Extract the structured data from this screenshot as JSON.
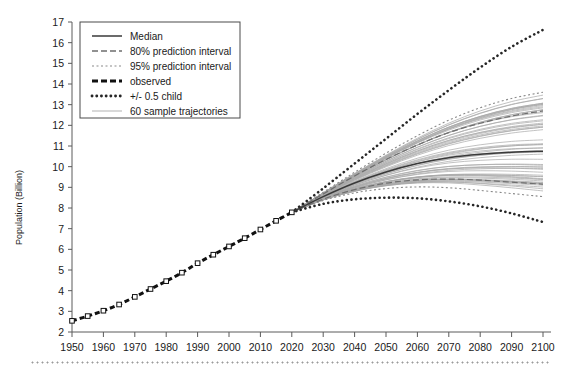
{
  "chart_data": {
    "type": "line",
    "title": "",
    "xlabel": "",
    "ylabel": "Population (Billion)",
    "xlim": [
      1945,
      2103
    ],
    "ylim": [
      2,
      17
    ],
    "grid": false,
    "legend_position": "top-left",
    "x_ticks": [
      1950,
      1960,
      1970,
      1980,
      1990,
      2000,
      2010,
      2020,
      2030,
      2040,
      2050,
      2060,
      2070,
      2080,
      2090,
      2100
    ],
    "y_ticks": [
      2,
      3,
      4,
      5,
      6,
      7,
      8,
      9,
      10,
      11,
      12,
      13,
      14,
      15,
      16,
      17
    ],
    "legend": [
      {
        "label": "Median",
        "style": "solid",
        "color": "#3a3a3a"
      },
      {
        "label": "80% prediction interval",
        "style": "dashed",
        "color": "#6e6e6e"
      },
      {
        "label": "95% prediction interval",
        "style": "dotted",
        "color": "#8a8a8a"
      },
      {
        "label": "observed",
        "style": "thick-dashed",
        "color": "#111111"
      },
      {
        "label": "+/- 0.5 child",
        "style": "thick-dotted",
        "color": "#262626"
      },
      {
        "label": "60 sample trajectories",
        "style": "thin-solid",
        "color": "#a8a8a8"
      }
    ],
    "series": [
      {
        "name": "observed",
        "style": "thick-dashed",
        "x": [
          1950,
          1955,
          1960,
          1965,
          1970,
          1975,
          1980,
          1985,
          1990,
          1995,
          2000,
          2005,
          2010,
          2015,
          2020
        ],
        "values": [
          2.54,
          2.77,
          3.03,
          3.33,
          3.7,
          4.08,
          4.46,
          4.87,
          5.33,
          5.74,
          6.14,
          6.54,
          6.96,
          7.38,
          7.79
        ]
      },
      {
        "name": "Median",
        "style": "solid",
        "x": [
          2020,
          2030,
          2040,
          2050,
          2060,
          2070,
          2080,
          2090,
          2100
        ],
        "values": [
          7.79,
          8.55,
          9.21,
          9.74,
          10.15,
          10.43,
          10.6,
          10.7,
          10.75
        ]
      },
      {
        "name": "80% prediction interval upper",
        "style": "dashed",
        "x": [
          2020,
          2030,
          2040,
          2050,
          2060,
          2070,
          2080,
          2090,
          2100
        ],
        "values": [
          7.79,
          8.68,
          9.55,
          10.35,
          11.05,
          11.65,
          12.1,
          12.45,
          12.7
        ]
      },
      {
        "name": "80% prediction interval lower",
        "style": "dashed",
        "x": [
          2020,
          2030,
          2040,
          2050,
          2060,
          2070,
          2080,
          2090,
          2100
        ],
        "values": [
          7.79,
          8.43,
          8.89,
          9.2,
          9.36,
          9.4,
          9.35,
          9.25,
          9.15
        ]
      },
      {
        "name": "95% prediction interval upper",
        "style": "dotted",
        "x": [
          2020,
          2030,
          2040,
          2050,
          2060,
          2070,
          2080,
          2090,
          2100
        ],
        "values": [
          7.79,
          8.76,
          9.73,
          10.65,
          11.5,
          12.25,
          12.85,
          13.3,
          13.6
        ]
      },
      {
        "name": "95% prediction interval lower",
        "style": "dotted",
        "x": [
          2020,
          2030,
          2040,
          2050,
          2060,
          2070,
          2080,
          2090,
          2100
        ],
        "values": [
          7.79,
          8.36,
          8.73,
          8.94,
          9.02,
          8.98,
          8.85,
          8.7,
          8.55
        ]
      },
      {
        "name": "+0.5 child",
        "style": "thick-dotted",
        "x": [
          2020,
          2030,
          2040,
          2050,
          2060,
          2070,
          2080,
          2090,
          2100
        ],
        "values": [
          7.79,
          8.95,
          10.15,
          11.35,
          12.55,
          13.7,
          14.8,
          15.8,
          16.62
        ]
      },
      {
        "name": "-0.5 child",
        "style": "thick-dotted",
        "x": [
          2020,
          2030,
          2040,
          2050,
          2060,
          2070,
          2080,
          2090,
          2100
        ],
        "values": [
          7.79,
          8.2,
          8.42,
          8.5,
          8.47,
          8.32,
          8.08,
          7.74,
          7.32
        ]
      }
    ],
    "trajectory_count": 60,
    "trajectory_start_year": 2020,
    "trajectory_start_value": 7.79,
    "trajectory_end_range": [
      9.2,
      13.5
    ]
  }
}
